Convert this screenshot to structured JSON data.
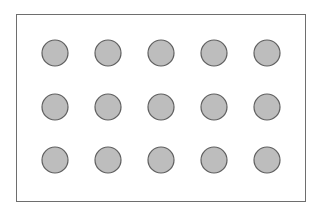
{
  "diagram": {
    "type": "dot-grid",
    "rows": 3,
    "columns": 5,
    "frame": {
      "x": 16,
      "y": 14,
      "width": 289,
      "height": 187,
      "stroke": "#6e6e6e"
    },
    "dot_style": {
      "radius": 13,
      "fill": "#bdbdbd",
      "stroke": "#5f5f5f"
    },
    "column_centers": [
      55,
      108,
      161,
      214,
      267
    ],
    "row_centers": [
      53,
      107,
      160
    ]
  }
}
